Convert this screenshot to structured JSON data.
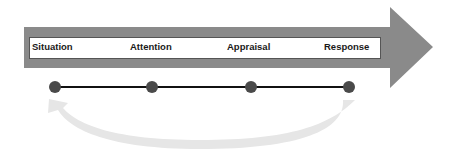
{
  "diagram": {
    "title": "",
    "stages": [
      {
        "label": "Situation",
        "x": 32
      },
      {
        "label": "Attention",
        "x": 130
      },
      {
        "label": "Appraisal",
        "x": 227
      },
      {
        "label": "Response",
        "x": 324
      }
    ],
    "colors": {
      "main_arrow": "#8a8a8a",
      "inner_box": "#ffffff",
      "inner_box_border": "#555555",
      "timeline_line": "#111111",
      "timeline_dot": "#4a4a4a",
      "feedback_arrow": "#e6e6e6"
    }
  }
}
